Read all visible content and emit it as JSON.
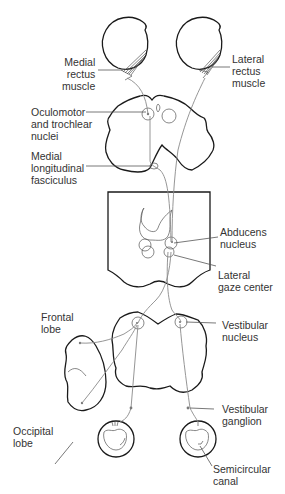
{
  "diagram": {
    "type": "neuroanatomy-pathway",
    "colors": {
      "outline": "#1a1a1a",
      "nerve": "#8a8a8a",
      "text": "#333333",
      "background": "#ffffff"
    },
    "labels": {
      "medial_rectus": "Medial\nrectus\nmuscle",
      "lateral_rectus": "Lateral\nrectus\nmuscle",
      "oculomotor": "Oculomotor\nand trochlear\nnuclei",
      "mlf": "Medial\nlongitudinal\nfasciculus",
      "abducens": "Abducens\nnucleus",
      "lateral_gaze": "Lateral\ngaze center",
      "frontal_lobe": "Frontal\nlobe",
      "vestibular_nucleus": "Vestibular\nnucleus",
      "occipital_lobe": "Occipital\nlobe",
      "vestibular_ganglion": "Vestibular\nganglion",
      "semicircular_canal": "Semicircular\ncanal"
    }
  }
}
